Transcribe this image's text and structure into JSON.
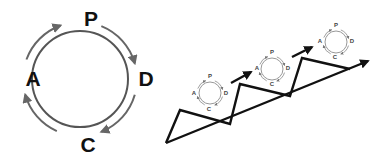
{
  "diagram": {
    "cycle": {
      "stages": [
        {
          "key": "plan",
          "letter": "P"
        },
        {
          "key": "do",
          "letter": "D"
        },
        {
          "key": "check",
          "letter": "C"
        },
        {
          "key": "act",
          "letter": "A"
        }
      ],
      "direction": "clockwise"
    },
    "improvement": {
      "mini_cycles": [
        {
          "letters": [
            "P",
            "D",
            "C",
            "A"
          ]
        },
        {
          "letters": [
            "P",
            "D",
            "C",
            "A"
          ]
        },
        {
          "letters": [
            "P",
            "D",
            "C",
            "A"
          ]
        }
      ],
      "steps": 3,
      "trend": "upward"
    },
    "colors": {
      "line": "#111111",
      "cycle_ring": "#555555",
      "cycle_arrows": "#666666",
      "mini_ring": "#999999"
    }
  }
}
